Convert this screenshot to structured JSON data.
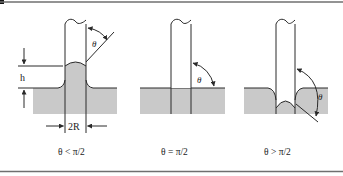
{
  "figure": {
    "border_color": "#6f6f6f",
    "liquid_color": "#c9c9c9",
    "line_color": "#2a2a2a"
  },
  "panels": [
    {
      "id": "hydrophilic",
      "theta_label": "θ",
      "height_label": "h",
      "diameter_label": "2R",
      "caption": "θ < π/2"
    },
    {
      "id": "neutral",
      "theta_label": "θ",
      "caption": "θ = π/2"
    },
    {
      "id": "hydrophobic",
      "theta_label": "θ",
      "caption": "θ > π/2"
    }
  ]
}
